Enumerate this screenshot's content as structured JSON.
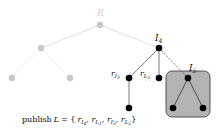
{
  "diagram": {
    "colors": {
      "faded": "#c8c8c8",
      "active": "#000000",
      "box_fill": "#b3b3b3",
      "box_stroke": "#333333",
      "dashed_faint": "#d9d9d9"
    },
    "labels": {
      "root": "R",
      "i4": "I",
      "i4_sub": "4",
      "ri3": "r",
      "ri3_sub": "I",
      "ri3_subsub": "3",
      "rl5": "r",
      "rl5_sub": "L",
      "rl5_subsub": "5",
      "i5": "I",
      "i5_sub": "5"
    },
    "caption": {
      "prefix": "publish",
      "var": "L",
      "eq": " = {",
      "items": [
        {
          "r": "r",
          "s": "I",
          "ss": "4"
        },
        {
          "r": "r",
          "s": "L",
          "ss": "1"
        },
        {
          "r": "r",
          "s": "I",
          "ss": "3"
        },
        {
          "r": "r",
          "s": "L",
          "ss": "5"
        }
      ],
      "sep": ", ",
      "close": "}"
    },
    "nodes": [
      {
        "id": "root",
        "x": 100,
        "y": 25,
        "state": "faded"
      },
      {
        "id": "left",
        "x": 41,
        "y": 48,
        "state": "faded"
      },
      {
        "id": "ll",
        "x": 12,
        "y": 78,
        "state": "faded"
      },
      {
        "id": "lr",
        "x": 70,
        "y": 78,
        "state": "faded"
      },
      {
        "id": "I4",
        "x": 159,
        "y": 48,
        "state": "active"
      },
      {
        "id": "rI3",
        "x": 129,
        "y": 78,
        "state": "active"
      },
      {
        "id": "rL5",
        "x": 159,
        "y": 78,
        "state": "active"
      },
      {
        "id": "I5",
        "x": 188,
        "y": 78,
        "state": "active"
      },
      {
        "id": "rI3c",
        "x": 129,
        "y": 108,
        "state": "active"
      },
      {
        "id": "I5l",
        "x": 173,
        "y": 108,
        "state": "active"
      },
      {
        "id": "I5r",
        "x": 203,
        "y": 108,
        "state": "active"
      }
    ]
  }
}
